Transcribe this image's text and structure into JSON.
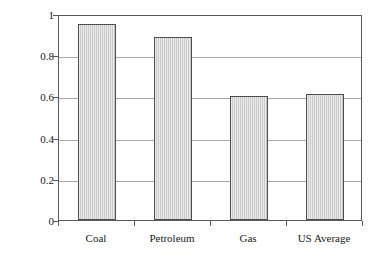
{
  "chart_data": {
    "type": "bar",
    "title": "",
    "xlabel": "",
    "ylabel_parts": {
      "pre": "CO",
      "sub1": "2",
      "mid": " emissions, kg CO",
      "sub2": "2",
      "post": "/kWh"
    },
    "ylabel": "CO2 emissions, kg CO2/kWh",
    "categories": [
      "Coal",
      "Petroleum",
      "Gas",
      "US Average"
    ],
    "values": [
      0.95,
      0.89,
      0.6,
      0.61
    ],
    "ylim": [
      0,
      1
    ],
    "yticks": [
      0,
      0.2,
      0.4,
      0.6,
      0.8,
      1
    ],
    "ytick_labels": [
      "0",
      "0.2",
      "0.4",
      "0.6",
      "0.8",
      "1"
    ],
    "grid": true,
    "grid_axis": "y",
    "legend": false,
    "legend_position": "none",
    "bar_fill_color": "#d2d2d2",
    "bar_border_color": "#4d4d4d",
    "axis_color": "#5a5a5a",
    "gridline_color": "#a9a9a9",
    "background_color": "#ffffff"
  }
}
